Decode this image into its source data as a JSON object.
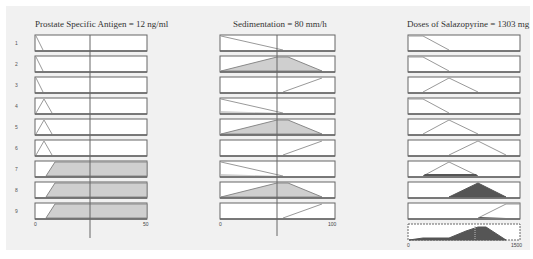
{
  "columns": [
    {
      "title": "Prostate Specific Antigen = 12 ng/ml",
      "axis_min": "0",
      "axis_max": "50",
      "input_value": 12,
      "rows": [
        "1",
        "2",
        "3",
        "4",
        "5",
        "6",
        "7",
        "8",
        "9"
      ]
    },
    {
      "title": "Sedimentation = 80 mm/h",
      "axis_min": "0",
      "axis_max": "100",
      "input_value": 80
    },
    {
      "title": "Doses of Salazopyrine = 1303 mg",
      "axis_min": "0",
      "axis_max": "1500",
      "output_value": 1303
    }
  ],
  "colors": {
    "fill_input": "#cfcfcf",
    "fill_output": "#555555",
    "line": "#888888",
    "marker": "#666666",
    "box_border": "#666666"
  }
}
